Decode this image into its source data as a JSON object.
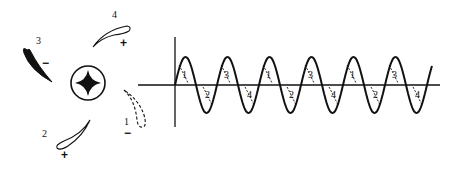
{
  "figure": {
    "colors": {
      "ink": "#111111",
      "background": "#ffffff"
    },
    "rotor": {
      "hub": {
        "cx": 88,
        "cy": 83,
        "r": 17,
        "icon": "cross-hub-icon"
      },
      "blades": [
        {
          "id": "1",
          "label": "1",
          "sign": "−",
          "style": "dashed",
          "label_pos": [
            124,
            125
          ],
          "sign_pos": [
            124,
            137
          ]
        },
        {
          "id": "2",
          "label": "2",
          "sign": "+",
          "style": "outline",
          "label_pos": [
            42,
            137
          ],
          "sign_pos": [
            61,
            159
          ]
        },
        {
          "id": "3",
          "label": "3",
          "sign": "−",
          "style": "filled",
          "label_pos": [
            36,
            44
          ],
          "sign_pos": [
            42,
            67
          ]
        },
        {
          "id": "4",
          "label": "4",
          "sign": "+",
          "style": "outline",
          "label_pos": [
            112,
            18
          ],
          "sign_pos": [
            120,
            47
          ]
        }
      ]
    },
    "waveform": {
      "axis_origin": [
        175,
        85
      ],
      "x_axis": {
        "from": 138,
        "to": 440
      },
      "y_axis": {
        "from": 37,
        "to": 127
      },
      "amplitude": 28,
      "period": 42,
      "start_x": 175,
      "end_x": 432,
      "tick_labels": [
        "1",
        "2",
        "3",
        "4",
        "1",
        "2",
        "3",
        "4",
        "1",
        "2",
        "3",
        "4"
      ]
    }
  }
}
